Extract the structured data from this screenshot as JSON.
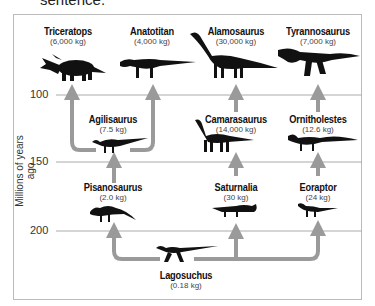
{
  "caption": "sentence.",
  "diagram": {
    "y_axis_label": "Millions of years ago",
    "ticks": [
      "100",
      "150",
      "200"
    ],
    "species": [
      {
        "name": "Triceratops",
        "mass": "(6,000 kg)"
      },
      {
        "name": "Anatotitan",
        "mass": "(4,000 kg)"
      },
      {
        "name": "Alamosaurus",
        "mass": "(30,000 kg)"
      },
      {
        "name": "Tyrannosaurus",
        "mass": "(7,000 kg)"
      },
      {
        "name": "Agilisaurus",
        "mass": "(7.5 kg)"
      },
      {
        "name": "Camarasaurus",
        "mass": "(14,000 kg)"
      },
      {
        "name": "Ornitholestes",
        "mass": "(12.6 kg)"
      },
      {
        "name": "Pisanosaurus",
        "mass": "(2.0 kg)"
      },
      {
        "name": "Saturnalia",
        "mass": "(30 kg)"
      },
      {
        "name": "Eoraptor",
        "mass": "(24 kg)"
      },
      {
        "name": "Lagosuchus",
        "mass": "(0.18 kg)"
      }
    ],
    "relationships": [
      {
        "from": "Lagosuchus",
        "to": "Pisanosaurus"
      },
      {
        "from": "Lagosuchus",
        "to": "Saturnalia"
      },
      {
        "from": "Lagosuchus",
        "to": "Eoraptor"
      },
      {
        "from": "Pisanosaurus",
        "to": "Agilisaurus"
      },
      {
        "from": "Agilisaurus",
        "to": "Triceratops"
      },
      {
        "from": "Agilisaurus",
        "to": "Anatotitan"
      },
      {
        "from": "Saturnalia",
        "to": "Camarasaurus"
      },
      {
        "from": "Camarasaurus",
        "to": "Alamosaurus"
      },
      {
        "from": "Eoraptor",
        "to": "Ornitholestes"
      },
      {
        "from": "Ornitholestes",
        "to": "Tyrannosaurus"
      }
    ],
    "colors": {
      "arrow": "#9a9a9a",
      "gridline": "#aaaaaa",
      "silhouette": "#111111"
    }
  }
}
